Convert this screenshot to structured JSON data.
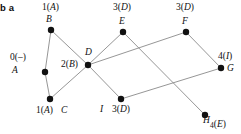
{
  "figure": {
    "caption": "b a",
    "width": 241,
    "height": 134,
    "background": "#ffffff",
    "edge_color": "#8a8a8a",
    "node_color": "#111111"
  },
  "graph": {
    "type": "shortest-path-tree-diagram",
    "node_radius": 3.2,
    "nodes": [
      {
        "id": "A",
        "name": "A",
        "x": 45,
        "y": 72,
        "distance": "0",
        "predecessor": "–",
        "dist_text": "0(–)",
        "dist_x": 10,
        "dist_y": 53,
        "name_x": 12,
        "name_y": 66
      },
      {
        "id": "B",
        "name": "B",
        "x": 51,
        "y": 30,
        "distance": "1",
        "predecessor": "A",
        "dist_text": "1(A)",
        "dist_x": 42,
        "dist_y": 3,
        "name_x": 46,
        "name_y": 15
      },
      {
        "id": "C",
        "name": "C",
        "x": 50,
        "y": 99,
        "distance": "1",
        "predecessor": "A",
        "dist_text": "1(A)",
        "dist_x": 36,
        "dist_y": 106,
        "name_x": 61,
        "name_y": 106
      },
      {
        "id": "D",
        "name": "D",
        "x": 88,
        "y": 65,
        "distance": "2",
        "predecessor": "B",
        "dist_text": "2(B)",
        "dist_x": 61,
        "dist_y": 60,
        "name_x": 85,
        "name_y": 48
      },
      {
        "id": "E",
        "name": "E",
        "x": 123,
        "y": 32,
        "distance": "3",
        "predecessor": "D",
        "dist_text": "3(D)",
        "dist_x": 113,
        "dist_y": 3,
        "name_x": 119,
        "name_y": 17
      },
      {
        "id": "F",
        "name": "F",
        "x": 186,
        "y": 32,
        "distance": "3",
        "predecessor": "D",
        "dist_text": "3(D)",
        "dist_x": 176,
        "dist_y": 3,
        "name_x": 182,
        "name_y": 17
      },
      {
        "id": "G",
        "name": "G",
        "x": 221,
        "y": 68,
        "distance": "4",
        "predecessor": "I",
        "dist_text": "4(I)",
        "dist_x": 218,
        "dist_y": 52,
        "name_x": 227,
        "name_y": 64
      },
      {
        "id": "I",
        "name": "I",
        "x": 121,
        "y": 99,
        "distance": "3",
        "predecessor": "D",
        "dist_text": "3(D)",
        "dist_x": 112,
        "dist_y": 105,
        "name_x": 100,
        "name_y": 105
      },
      {
        "id": "H",
        "name": "H",
        "x": 205,
        "y": 115,
        "distance": "4",
        "predecessor": "E",
        "dist_text": "4(E)",
        "dist_x": 210,
        "dist_y": 120,
        "name_x": 203,
        "name_y": 116
      }
    ],
    "edges": [
      {
        "from": "A",
        "to": "B"
      },
      {
        "from": "A",
        "to": "C"
      },
      {
        "from": "B",
        "to": "D"
      },
      {
        "from": "C",
        "to": "D"
      },
      {
        "from": "D",
        "to": "E"
      },
      {
        "from": "D",
        "to": "F"
      },
      {
        "from": "D",
        "to": "I"
      },
      {
        "from": "E",
        "to": "H"
      },
      {
        "from": "F",
        "to": "G"
      },
      {
        "from": "I",
        "to": "G"
      }
    ]
  }
}
